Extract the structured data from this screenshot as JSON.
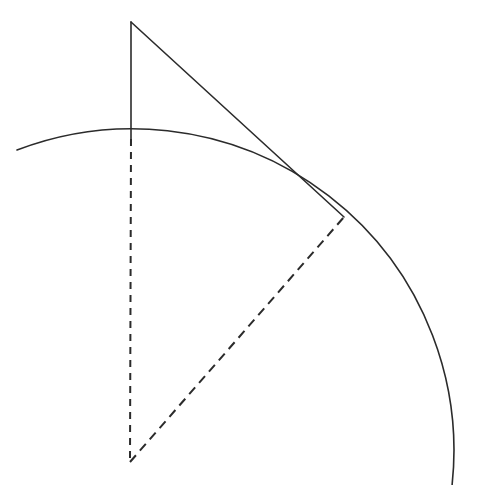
{
  "figure": {
    "type": "geometric-diagram",
    "canvas": {
      "width": 486,
      "height": 485,
      "background": "#ffffff"
    },
    "style": {
      "stroke_color": "#2b2b2b",
      "solid_stroke_width": 1.6,
      "dashed_stroke_width": 2.0,
      "radius_dash_pattern": "9 6",
      "vertical_dash_pattern": "7 6"
    }
  },
  "points": {
    "apex": {
      "name": "apex",
      "x": 131,
      "y": 22,
      "label": ""
    },
    "arc_top": {
      "name": "arc-top",
      "x": 131,
      "y": 139,
      "label": ""
    },
    "center": {
      "name": "circle-center",
      "x": 130,
      "y": 462,
      "label": ""
    },
    "tangency": {
      "name": "tangency-point",
      "x": 344,
      "y": 217,
      "label": ""
    },
    "arc_start_left": {
      "name": "arc-left-end",
      "x": 17,
      "y": 150,
      "label": ""
    },
    "arc_end_bottom": {
      "name": "arc-bottom-end",
      "x": 452,
      "y": 486,
      "label": ""
    }
  },
  "circle": {
    "center_x": 130,
    "center_y": 462,
    "radius": 322,
    "arc_sweep_description": "quarter-arc from upper-left through top apex to lower-right"
  },
  "segments": [
    {
      "name": "vertical-solid-segment",
      "style": "solid",
      "from": "apex",
      "to": "arc_top",
      "x1": 131,
      "y1": 22,
      "x2": 131,
      "y2": 139
    },
    {
      "name": "tangent-line",
      "style": "solid",
      "from": "apex",
      "to": "tangency",
      "x1": 131,
      "y1": 22,
      "x2": 344,
      "y2": 217
    },
    {
      "name": "vertical-dashed-segment",
      "style": "dashed",
      "from": "arc_top",
      "to": "center",
      "x1": 131,
      "y1": 139,
      "x2": 130,
      "y2": 462
    },
    {
      "name": "radius-dashed-segment",
      "style": "dashed",
      "from": "center",
      "to": "tangency",
      "x1": 130,
      "y1": 462,
      "x2": 344,
      "y2": 217
    }
  ],
  "arc": {
    "name": "circular-arc",
    "style": "solid",
    "path": "M 17 150 A 322 322 0 0 1 452 486"
  },
  "labels": []
}
